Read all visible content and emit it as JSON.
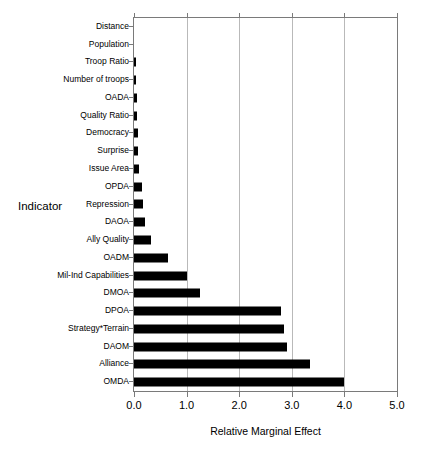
{
  "chart_data": {
    "type": "bar",
    "orientation": "horizontal",
    "title": "",
    "xlabel": "Relative Marginal Effect",
    "ylabel": "Indicator",
    "xlim": [
      0.0,
      5.0
    ],
    "xticks": [
      "0.0",
      "1.0",
      "2.0",
      "3.0",
      "4.0",
      "5.0"
    ],
    "xtick_values": [
      0.0,
      1.0,
      2.0,
      3.0,
      4.0,
      5.0
    ],
    "grid": "vertical",
    "legend": "none",
    "bar_color": "#000000",
    "categories": [
      "Distance",
      "Population",
      "Troop Ratio",
      "Number of troops",
      "OADA",
      "Quality Ratio",
      "Democracy",
      "Surprise",
      "Issue Area",
      "OPDA",
      "Repression",
      "DAOA",
      "Ally Quality",
      "OADM",
      "Mil-Ind Capabilities",
      "DMOA",
      "DPOA",
      "Strategy*Terrain",
      "DAOM",
      "Alliance",
      "OMDA"
    ],
    "values": [
      0.0,
      0.0,
      0.03,
      0.04,
      0.05,
      0.06,
      0.07,
      0.08,
      0.1,
      0.15,
      0.17,
      0.2,
      0.33,
      0.65,
      1.0,
      1.25,
      2.8,
      2.85,
      2.9,
      3.35,
      4.0
    ]
  }
}
